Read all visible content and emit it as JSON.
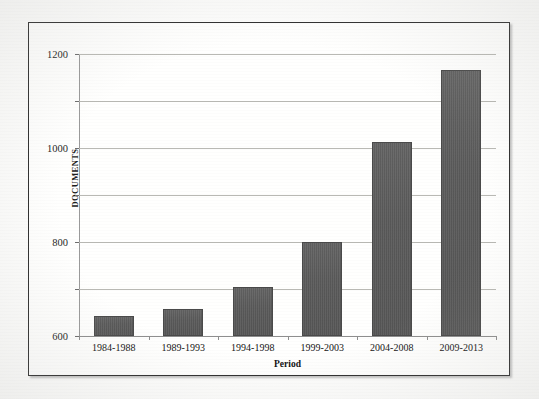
{
  "figure": {
    "background_color": "#fffffe",
    "frame_color": "#2e2e2e"
  },
  "chart_data": {
    "type": "bar",
    "title": "",
    "xlabel": "Period",
    "ylabel": "DOCUMENTS",
    "categories": [
      "1984-1988",
      "1989-1993",
      "1994-1998",
      "1999-2003",
      "2004-2008",
      "2009-2013"
    ],
    "values": [
      85,
      115,
      210,
      400,
      825,
      1130
    ],
    "ylim": [
      0,
      1200
    ],
    "yticks": [
      0,
      200,
      400,
      600,
      800,
      1000,
      1200
    ],
    "ytick_labels": [
      "0",
      "200",
      "400",
      "600",
      "800",
      "1000",
      "1200"
    ],
    "grid": true,
    "legend": "none",
    "bar_color": "#5c5c5c",
    "gridline_color": "#b9b9b4",
    "axis_color": "#8e8e8e"
  }
}
